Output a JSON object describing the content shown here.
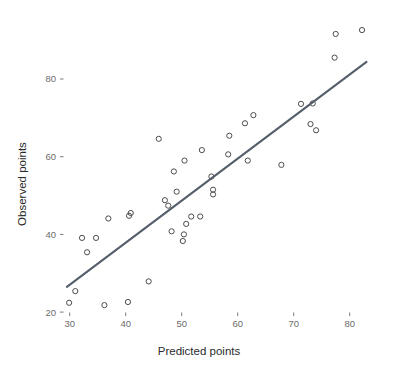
{
  "chart_data": {
    "type": "scatter",
    "title": "",
    "xlabel": "Predicted points",
    "ylabel": "Observed points",
    "xlim": [
      26,
      86
    ],
    "ylim": [
      17,
      95
    ],
    "xticks": [
      30,
      40,
      50,
      60,
      70,
      80
    ],
    "yticks": [
      20,
      40,
      60,
      80
    ],
    "xtick_labels": [
      "30",
      "40",
      "50",
      "60",
      "70",
      "80"
    ],
    "ytick_labels": [
      "20",
      "40",
      "60",
      "80"
    ],
    "grid": false,
    "legend": "none",
    "point_style": {
      "marker": "open-circle",
      "radius": 2.6,
      "stroke": "#4c4c4c",
      "fill": "none"
    },
    "points": [
      {
        "x": 29.9,
        "y": 22.4
      },
      {
        "x": 31.0,
        "y": 25.4
      },
      {
        "x": 32.2,
        "y": 39.1
      },
      {
        "x": 33.1,
        "y": 35.4
      },
      {
        "x": 34.7,
        "y": 39.1
      },
      {
        "x": 36.2,
        "y": 21.8
      },
      {
        "x": 36.9,
        "y": 44.1
      },
      {
        "x": 40.4,
        "y": 22.6
      },
      {
        "x": 40.6,
        "y": 44.8
      },
      {
        "x": 40.9,
        "y": 45.5
      },
      {
        "x": 44.1,
        "y": 27.9
      },
      {
        "x": 45.9,
        "y": 64.6
      },
      {
        "x": 47.0,
        "y": 48.8
      },
      {
        "x": 47.6,
        "y": 47.4
      },
      {
        "x": 48.2,
        "y": 40.8
      },
      {
        "x": 48.6,
        "y": 56.2
      },
      {
        "x": 49.1,
        "y": 51.0
      },
      {
        "x": 50.2,
        "y": 38.3
      },
      {
        "x": 50.4,
        "y": 40.0
      },
      {
        "x": 50.5,
        "y": 59.0
      },
      {
        "x": 50.8,
        "y": 42.7
      },
      {
        "x": 51.7,
        "y": 44.6
      },
      {
        "x": 53.3,
        "y": 44.6
      },
      {
        "x": 53.6,
        "y": 61.7
      },
      {
        "x": 55.3,
        "y": 54.9
      },
      {
        "x": 55.6,
        "y": 51.5
      },
      {
        "x": 55.6,
        "y": 50.3
      },
      {
        "x": 58.3,
        "y": 60.6
      },
      {
        "x": 58.5,
        "y": 65.4
      },
      {
        "x": 61.3,
        "y": 68.6
      },
      {
        "x": 61.8,
        "y": 59.0
      },
      {
        "x": 62.8,
        "y": 70.7
      },
      {
        "x": 67.8,
        "y": 57.9
      },
      {
        "x": 71.3,
        "y": 73.6
      },
      {
        "x": 73.0,
        "y": 68.4
      },
      {
        "x": 73.4,
        "y": 73.7
      },
      {
        "x": 74.0,
        "y": 66.8
      },
      {
        "x": 77.3,
        "y": 85.5
      },
      {
        "x": 77.5,
        "y": 91.6
      },
      {
        "x": 82.2,
        "y": 92.6
      }
    ],
    "fit_line": {
      "style": "solid",
      "color": "#555f6b",
      "width": 2.1,
      "x_start": 29.5,
      "y_start": 26.5,
      "x_end": 83.0,
      "y_end": 84.4
    }
  }
}
